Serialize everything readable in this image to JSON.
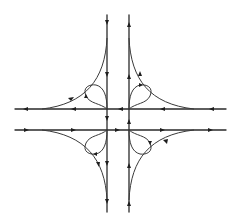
{
  "diagram": {
    "title": "",
    "type": "cloverleaf-interchange",
    "colors": {
      "line": "#2a2a2a",
      "background": "#ffffff"
    },
    "roads": [
      {
        "id": "southbound",
        "orientation": "vertical",
        "x": 107,
        "from": 15,
        "to": 212,
        "direction": "down"
      },
      {
        "id": "northbound",
        "orientation": "vertical",
        "x": 129,
        "from": 212,
        "to": 15,
        "direction": "up"
      },
      {
        "id": "westbound",
        "orientation": "horizontal",
        "y": 109,
        "from": 226,
        "to": 15,
        "direction": "left"
      },
      {
        "id": "eastbound",
        "orientation": "horizontal",
        "y": 130,
        "from": 15,
        "to": 226,
        "direction": "right"
      }
    ],
    "ramps": [
      {
        "id": "nw-outer-ramp",
        "from": "southbound",
        "to": "westbound",
        "direction": "down-left"
      },
      {
        "id": "ne-outer-ramp",
        "from": "westbound",
        "to": "northbound",
        "direction": "up-left"
      },
      {
        "id": "sw-outer-ramp",
        "from": "eastbound",
        "to": "southbound",
        "direction": "down-right"
      },
      {
        "id": "se-outer-ramp",
        "from": "northbound",
        "to": "eastbound",
        "direction": "up-right"
      }
    ],
    "loops": [
      {
        "id": "nw-loop",
        "quadrant": "NW"
      },
      {
        "id": "ne-loop",
        "quadrant": "NE"
      },
      {
        "id": "sw-loop",
        "quadrant": "SW"
      },
      {
        "id": "se-loop",
        "quadrant": "SE"
      }
    ]
  }
}
